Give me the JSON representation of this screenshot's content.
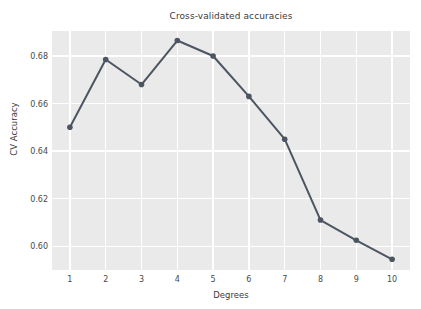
{
  "chart_data": {
    "type": "line",
    "title": "Cross-validated accuracies",
    "xlabel": "Degrees",
    "ylabel": "CV Accuracy",
    "x": [
      1,
      2,
      3,
      4,
      5,
      6,
      7,
      8,
      9,
      10
    ],
    "values": [
      0.65,
      0.6785,
      0.668,
      0.6865,
      0.68,
      0.663,
      0.645,
      0.611,
      0.6025,
      0.5945
    ],
    "categories": [
      "1",
      "2",
      "3",
      "4",
      "5",
      "6",
      "7",
      "8",
      "9",
      "10"
    ],
    "xtick_labels": [
      "1",
      "2",
      "3",
      "4",
      "5",
      "6",
      "7",
      "8",
      "9",
      "10"
    ],
    "ytick_labels": [
      "0.60",
      "0.62",
      "0.64",
      "0.66",
      "0.68"
    ],
    "ytick_values": [
      0.6,
      0.62,
      0.64,
      0.66,
      0.68
    ],
    "xlim": [
      0.5,
      10.5
    ],
    "ylim": [
      0.59,
      0.6905
    ],
    "grid": true,
    "legend": null,
    "series_name": "CV Accuracy",
    "marker": "circle",
    "line_color": "#4c5561",
    "marker_color": "#4c5561",
    "plot_background": "#eaeaea",
    "grid_color": "#ffffff",
    "figure_background": "#ffffff",
    "text_color": "#3b3b3b"
  }
}
